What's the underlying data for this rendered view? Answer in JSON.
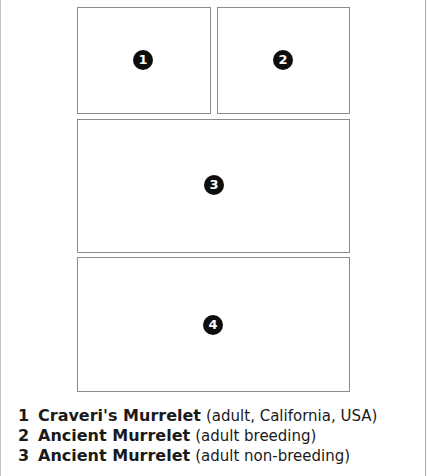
{
  "plates": [
    {
      "id": "plate-1",
      "marker": "1"
    },
    {
      "id": "plate-2",
      "marker": "2"
    },
    {
      "id": "plate-3",
      "marker": "3"
    },
    {
      "id": "plate-4",
      "marker": "4"
    }
  ],
  "caption": [
    {
      "number": "1",
      "name": "Craveri's Murrelet",
      "description": "(adult, California, USA)"
    },
    {
      "number": "2",
      "name": "Ancient Murrelet",
      "description": "(adult breeding)"
    },
    {
      "number": "3",
      "name": "Ancient Murrelet",
      "description": "(adult non-breeding)"
    }
  ],
  "colors": {
    "marker_fill": "#0d0d0d",
    "marker_text": "#ffffff",
    "plate_border": "#8c8c8c",
    "text": "#1a1a1a"
  }
}
